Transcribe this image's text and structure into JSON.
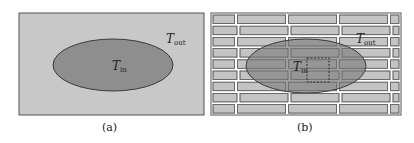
{
  "panels": [
    {
      "id": "a",
      "caption": "(a)",
      "inner_label": {
        "main": "T",
        "sub": "in"
      },
      "outer_label": {
        "main": "T",
        "sub": "out"
      }
    },
    {
      "id": "b",
      "caption": "(b)",
      "inner_label": {
        "main": "T",
        "sub": "in"
      },
      "outer_label": {
        "main": "T",
        "sub": "out"
      }
    }
  ],
  "colors": {
    "background_fill": "#c8c8c8",
    "ellipse_fill": "#8e8e8e",
    "brick_fill": "#c4c4c4",
    "mortar": "#ffffff",
    "stroke": "#4a4a4a"
  }
}
